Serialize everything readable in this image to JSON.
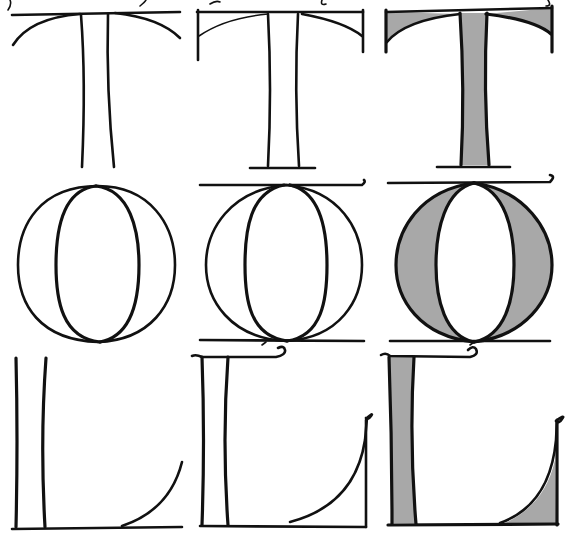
{
  "figure": {
    "letters": [
      "T",
      "O",
      "L"
    ],
    "stages": [
      {
        "name": "skeleton",
        "label": "Outline strokes only"
      },
      {
        "name": "serifed",
        "label": "Outline with serifs and flourishes"
      },
      {
        "name": "filled",
        "label": "Filled with gray tone"
      }
    ],
    "colors": {
      "ink": "#111111",
      "fill": "#a8a8a8",
      "background": "#ffffff"
    },
    "grid": {
      "columns": 3,
      "rows": 3
    }
  }
}
